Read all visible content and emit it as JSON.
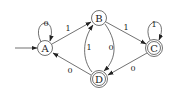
{
  "diagram": {
    "type": "DFA",
    "states": [
      {
        "id": "A",
        "label": "A",
        "accepting": false,
        "start": true
      },
      {
        "id": "B",
        "label": "B",
        "accepting": false,
        "start": false
      },
      {
        "id": "C",
        "label": "C",
        "accepting": true,
        "start": false
      },
      {
        "id": "D",
        "label": "D",
        "accepting": true,
        "start": false
      }
    ],
    "transitions": [
      {
        "from": "A",
        "to": "A",
        "label": "0"
      },
      {
        "from": "A",
        "to": "B",
        "label": "1"
      },
      {
        "from": "B",
        "to": "C",
        "label": "1"
      },
      {
        "from": "B",
        "to": "D",
        "label": "0"
      },
      {
        "from": "D",
        "to": "B",
        "label": "1"
      },
      {
        "from": "C",
        "to": "C",
        "label": "1"
      },
      {
        "from": "C",
        "to": "D",
        "label": "0"
      },
      {
        "from": "D",
        "to": "A",
        "label": "0"
      }
    ]
  }
}
